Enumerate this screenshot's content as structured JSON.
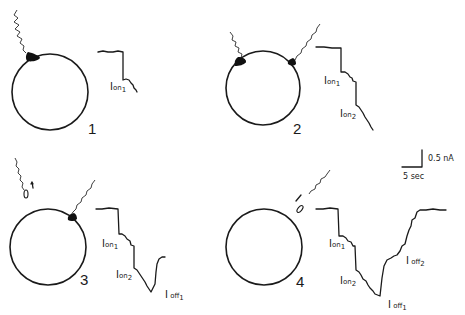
{
  "figure": {
    "panels": [
      {
        "number": "1",
        "electrodes": [
          "top-left-attached"
        ],
        "trace_labels": [
          {
            "main": "I",
            "mid": "on",
            "sub": "1"
          }
        ]
      },
      {
        "number": "2",
        "electrodes": [
          "top-left-attached",
          "top-right-attached"
        ],
        "trace_labels": [
          {
            "main": "I",
            "mid": "on",
            "sub": "1"
          },
          {
            "main": "I",
            "mid": "on",
            "sub": "2"
          }
        ]
      },
      {
        "number": "3",
        "electrodes": [
          "top-left-withdrawn",
          "top-right-attached"
        ],
        "trace_labels": [
          {
            "main": "I",
            "mid": "on",
            "sub": "1"
          },
          {
            "main": "I",
            "mid": "on",
            "sub": "2"
          },
          {
            "main": "I",
            "mid": " off",
            "sub": "1"
          }
        ]
      },
      {
        "number": "4",
        "electrodes": [
          "top-right-withdrawn"
        ],
        "trace_labels": [
          {
            "main": "I",
            "mid": "on",
            "sub": "1"
          },
          {
            "main": "I",
            "mid": "on",
            "sub": "2"
          },
          {
            "main": "I",
            "mid": " off",
            "sub": "1"
          },
          {
            "main": "I",
            "mid": " off",
            "sub": "2"
          }
        ]
      }
    ],
    "scale_bar": {
      "current": "0.5 nA",
      "time": "5 sec"
    },
    "colors": {
      "ink": "#1a1a1a",
      "background": "#ffffff"
    }
  }
}
